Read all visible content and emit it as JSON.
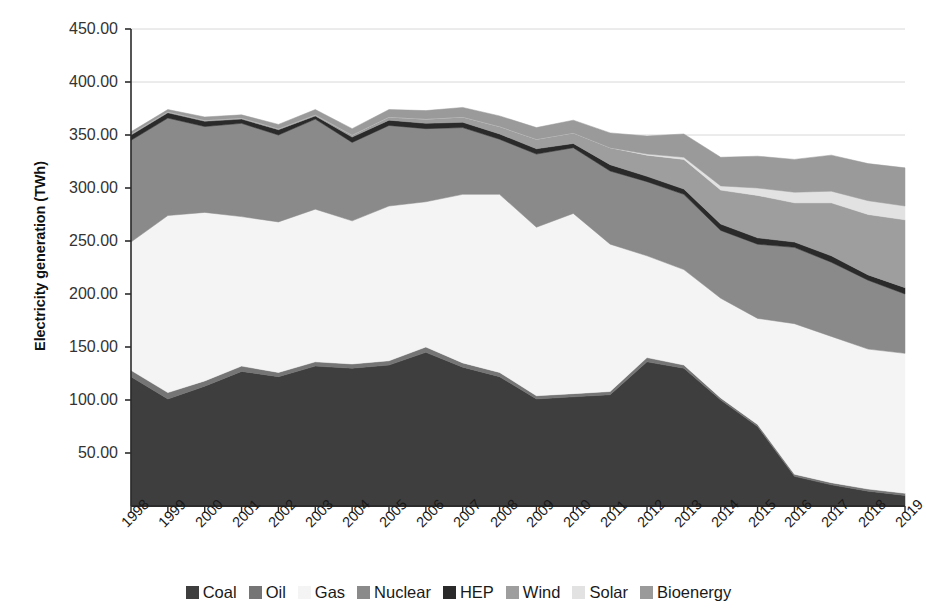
{
  "axes": {
    "y_title": "Electricity generation (TWh)",
    "y_ticks": [
      "450.00",
      "400.00",
      "350.00",
      "300.00",
      "250.00",
      "200.00",
      "150.00",
      "100.00",
      "50.00"
    ]
  },
  "legend": {
    "items": [
      {
        "label": "Coal",
        "color": "#3E3E3E"
      },
      {
        "label": "Oil",
        "color": "#757575"
      },
      {
        "label": "Gas",
        "color": "#F4F4F4"
      },
      {
        "label": "Nuclear",
        "color": "#8A8A8A"
      },
      {
        "label": "HEP",
        "color": "#2A2A2A"
      },
      {
        "label": "Wind",
        "color": "#9E9E9E"
      },
      {
        "label": "Solar",
        "color": "#E2E2E2"
      },
      {
        "label": "Bioenergy",
        "color": "#9A9A9A"
      }
    ]
  },
  "chart_data": {
    "type": "area",
    "stacked": true,
    "title": "",
    "xlabel": "",
    "ylabel": "Electricity generation (TWh)",
    "ylim": [
      0,
      450
    ],
    "grid": true,
    "legend_position": "bottom",
    "categories": [
      "1998",
      "1999",
      "2000",
      "2001",
      "2002",
      "2003",
      "2004",
      "2005",
      "2006",
      "2007",
      "2008",
      "2009",
      "2010",
      "2011",
      "2012",
      "2013",
      "2014",
      "2015",
      "2016",
      "2017",
      "2018",
      "2019"
    ],
    "series": [
      {
        "name": "Coal",
        "color": "#3E3E3E",
        "values": [
          122,
          101,
          113,
          127,
          122,
          132,
          130,
          133,
          145,
          131,
          122,
          101,
          103,
          105,
          136,
          130,
          100,
          75,
          28,
          20,
          14,
          10
        ]
      },
      {
        "name": "Oil",
        "color": "#757575",
        "values": [
          6,
          6,
          5,
          5,
          4,
          4,
          4,
          4,
          5,
          4,
          4,
          3,
          3,
          3,
          4,
          3,
          2,
          2,
          2,
          2,
          2,
          2
        ]
      },
      {
        "name": "Gas",
        "color": "#F4F4F4",
        "values": [
          121,
          167,
          159,
          141,
          142,
          144,
          135,
          146,
          137,
          159,
          168,
          159,
          170,
          139,
          96,
          90,
          94,
          100,
          142,
          138,
          132,
          132
        ]
      },
      {
        "name": "Nuclear",
        "color": "#8A8A8A",
        "values": [
          96,
          92,
          81,
          88,
          82,
          85,
          74,
          76,
          69,
          63,
          52,
          69,
          62,
          69,
          70,
          71,
          64,
          70,
          72,
          70,
          65,
          56
        ]
      },
      {
        "name": "HEP",
        "color": "#2A2A2A",
        "values": [
          5,
          5,
          5,
          4,
          5,
          3,
          5,
          5,
          5,
          5,
          5,
          5,
          4,
          6,
          5,
          5,
          6,
          6,
          5,
          6,
          5,
          6
        ]
      },
      {
        "name": "Wind",
        "color": "#9E9E9E",
        "values": [
          1,
          1,
          1,
          1,
          1,
          1,
          2,
          3,
          4,
          5,
          7,
          9,
          10,
          16,
          20,
          28,
          32,
          40,
          37,
          50,
          57,
          64
        ]
      },
      {
        "name": "Solar",
        "color": "#E2E2E2",
        "values": [
          0,
          0,
          0,
          0,
          0,
          0,
          0,
          0,
          0,
          0,
          0,
          0,
          0,
          0,
          1,
          2,
          4,
          7,
          10,
          11,
          13,
          13
        ]
      },
      {
        "name": "Bioenergy",
        "color": "#9A9A9A",
        "values": [
          2,
          2,
          3,
          3,
          4,
          5,
          6,
          7,
          8,
          9,
          10,
          11,
          12,
          14,
          17,
          22,
          27,
          30,
          31,
          34,
          35,
          36
        ]
      }
    ]
  }
}
